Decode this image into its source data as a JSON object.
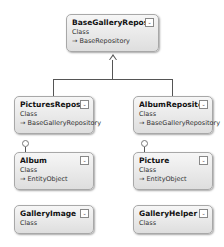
{
  "diagram": {
    "classes": [
      {
        "name": "BaseGalleryRepository",
        "kind": "Class",
        "base": "→ BaseRepository"
      },
      {
        "name": "PicturesReposit...",
        "kind": "Class",
        "base": "→ BaseGalleryRepository"
      },
      {
        "name": "AlbumRepository",
        "kind": "Class",
        "base": "→ BaseGalleryRepository"
      },
      {
        "name": "Album",
        "kind": "Class",
        "base": "→ EntityObject"
      },
      {
        "name": "Picture",
        "kind": "Class",
        "base": "→ EntityObject"
      },
      {
        "name": "GalleryImage",
        "kind": "Class"
      },
      {
        "name": "GalleryHelper",
        "kind": "Class"
      }
    ],
    "toggle_icon": "⌄"
  }
}
